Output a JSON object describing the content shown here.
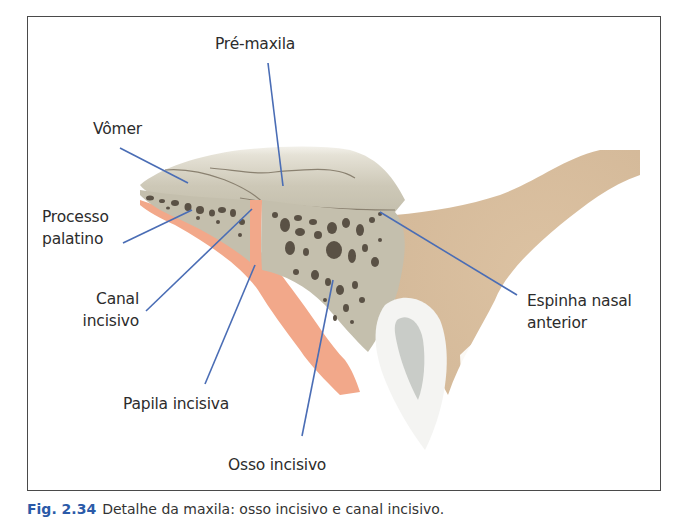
{
  "figure": {
    "caption_label": "Fig. 2.34",
    "caption_text": "Detalhe da maxila: osso incisivo e canal incisivo.",
    "colors": {
      "leader_line": "#4a6db5",
      "cortical_bone": "#c9c4b2",
      "cancellous_bone": "#bdb8a6",
      "marrow_spaces": "#5a5145",
      "mucosa": "#f2a88a",
      "soft_tissue": "#d8bf9f",
      "tooth_enamel": "#f4f4f2",
      "tooth_pulp": "#c9ccc8",
      "frame": "#4a4a4a",
      "text": "#2c2c2c"
    }
  },
  "labels": {
    "pre_maxila": "Pré-maxila",
    "vomer": "Vômer",
    "processo_palatino": [
      "Processo",
      "palatino"
    ],
    "canal_incisivo": [
      "Canal",
      "incisivo"
    ],
    "espinha_nasal_anterior": [
      "Espinha nasal",
      "anterior"
    ],
    "papila_incisiva": "Papila incisiva",
    "osso_incisivo": "Osso incisivo"
  }
}
